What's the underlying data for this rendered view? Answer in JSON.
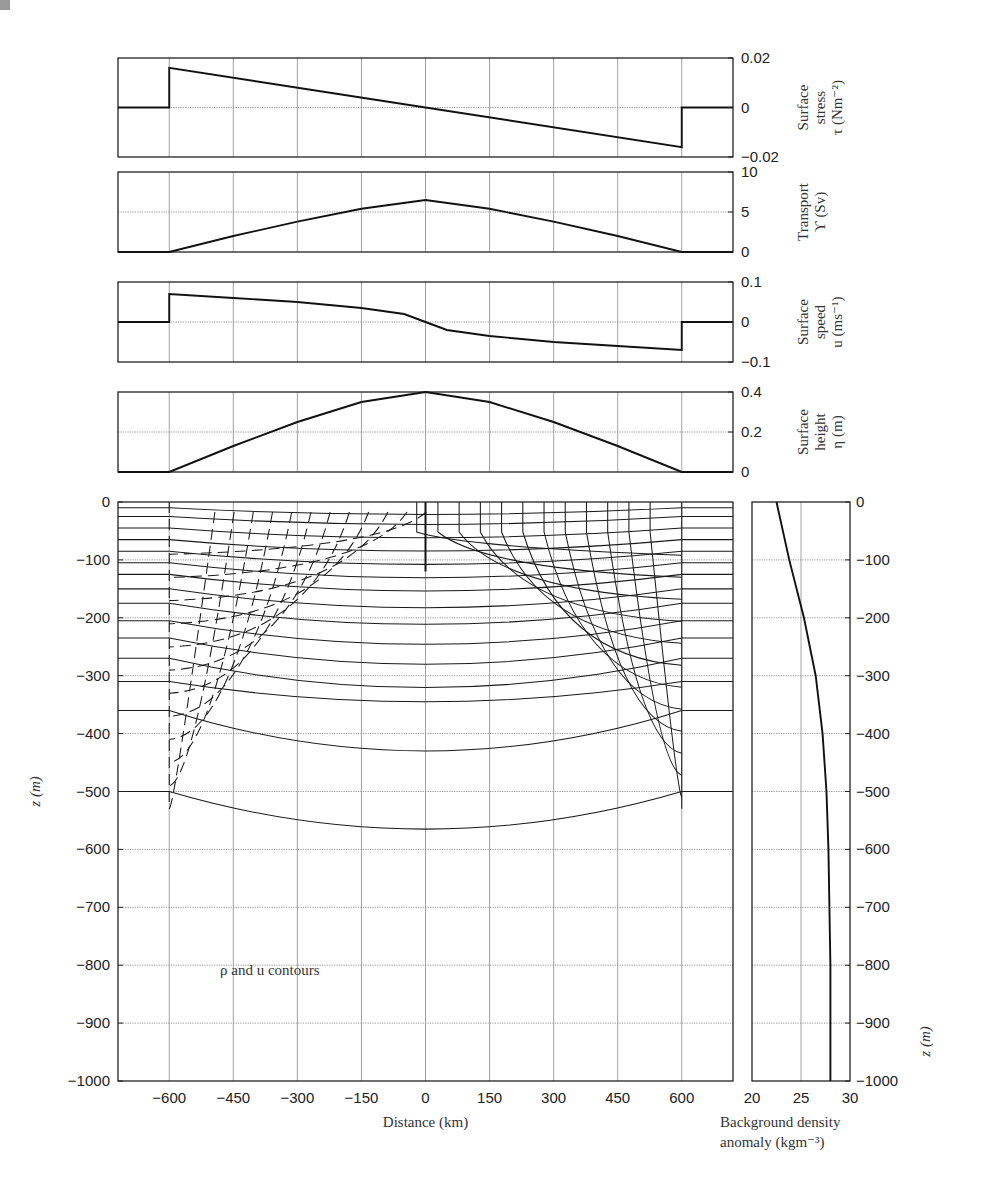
{
  "figure": {
    "annotation": "ρ and u contours"
  },
  "chart_data": [
    {
      "type": "line",
      "panel": "surface-stress",
      "ylabel_lines": [
        "Surface",
        "stress",
        "τ (Nm⁻²)"
      ],
      "x": [
        -720,
        -600,
        -600,
        0,
        600,
        600,
        720
      ],
      "values": [
        0,
        0,
        0.016,
        0,
        -0.016,
        0,
        0
      ],
      "ylim": [
        -0.02,
        0.02
      ],
      "yticks": [
        "0.02",
        "0",
        "−0.02"
      ],
      "xlim": [
        -720,
        720
      ],
      "grid": true
    },
    {
      "type": "line",
      "panel": "transport",
      "ylabel_lines": [
        "Transport",
        "ϒ (Sv)"
      ],
      "x": [
        -720,
        -600,
        -450,
        -300,
        -150,
        0,
        150,
        300,
        450,
        600,
        720
      ],
      "values": [
        0,
        0,
        2.0,
        3.8,
        5.4,
        6.5,
        5.4,
        3.8,
        2.0,
        0,
        0
      ],
      "ylim": [
        0,
        10
      ],
      "yticks": [
        "10",
        "5",
        "0"
      ],
      "xlim": [
        -720,
        720
      ],
      "grid": true
    },
    {
      "type": "line",
      "panel": "surface-speed",
      "ylabel_lines": [
        "Surface",
        "speed",
        "u (ms⁻¹)"
      ],
      "x": [
        -720,
        -600,
        -600,
        -450,
        -300,
        -150,
        -50,
        0,
        50,
        150,
        300,
        450,
        600,
        600,
        720
      ],
      "values": [
        0,
        0,
        0.07,
        0.06,
        0.05,
        0.035,
        0.02,
        0,
        -0.02,
        -0.035,
        -0.05,
        -0.06,
        -0.07,
        0,
        0
      ],
      "ylim": [
        -0.1,
        0.1
      ],
      "yticks": [
        "0.1",
        "0",
        "−0.1"
      ],
      "xlim": [
        -720,
        720
      ],
      "grid": true
    },
    {
      "type": "line",
      "panel": "surface-height",
      "ylabel_lines": [
        "Surface",
        "height",
        "η (m)"
      ],
      "x": [
        -720,
        -600,
        -450,
        -300,
        -150,
        0,
        150,
        300,
        450,
        600,
        720
      ],
      "values": [
        0,
        0,
        0.13,
        0.25,
        0.35,
        0.4,
        0.35,
        0.25,
        0.13,
        0,
        0
      ],
      "ylim": [
        0,
        0.4
      ],
      "yticks": [
        "0.4",
        "0.2",
        "0"
      ],
      "xlim": [
        -720,
        720
      ],
      "grid": true
    },
    {
      "type": "line",
      "panel": "contours",
      "title": "ρ and u contours",
      "xlabel": "Distance (km)",
      "ylabel": "z (m)",
      "xticks": [
        "−600",
        "−450",
        "−300",
        "−150",
        "0",
        "150",
        "300",
        "450",
        "600"
      ],
      "yticks": [
        "0",
        "−100",
        "−200",
        "−300",
        "−400",
        "−500",
        "−600",
        "−700",
        "−800",
        "−900",
        "−1000"
      ],
      "xlim": [
        -720,
        720
      ],
      "ylim": [
        -1000,
        0
      ],
      "density_contour_depths_at_boundary": [
        -10,
        -25,
        -45,
        -65,
        -85,
        -105,
        -125,
        -150,
        -175,
        -205,
        -235,
        -270,
        -310,
        -360,
        -500
      ],
      "density_contour_depths_at_center": [
        -5,
        -45,
        -65,
        -90,
        -110,
        -130,
        -160,
        -195,
        -240,
        -290,
        -345,
        -430,
        -565
      ],
      "series": [
        {
          "name": "density contours",
          "style": "solid"
        },
        {
          "name": "u contours",
          "style": "dashed"
        }
      ],
      "grid": true
    },
    {
      "type": "line",
      "panel": "background-density",
      "xlabel_lines": [
        "Background density",
        "anomaly (kgm⁻³)"
      ],
      "ylabel": "z (m)",
      "x": [
        22.5,
        23.8,
        25.3,
        26.5,
        27.2,
        27.6,
        27.8,
        27.9,
        28.0,
        28.0,
        28.0
      ],
      "y": [
        0,
        -100,
        -200,
        -300,
        -400,
        -500,
        -600,
        -700,
        -800,
        -900,
        -1000
      ],
      "xlim": [
        20,
        30
      ],
      "ylim": [
        -1000,
        0
      ],
      "xticks": [
        "20",
        "25",
        "30"
      ],
      "yticks": [
        "0",
        "−100",
        "−200",
        "−300",
        "−400",
        "−500",
        "−600",
        "−700",
        "−800",
        "−900",
        "−1000"
      ],
      "grid": true
    }
  ]
}
